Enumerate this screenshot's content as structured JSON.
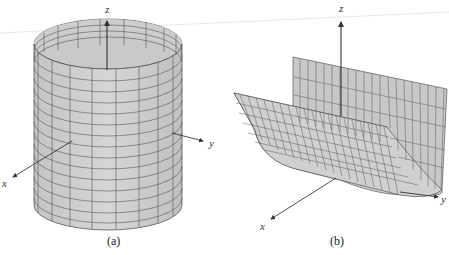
{
  "figures": [
    {
      "id": "a",
      "caption": "(a)",
      "surface": "cylinder",
      "axes": {
        "x": "x",
        "y": "y",
        "z": "z"
      }
    },
    {
      "id": "b",
      "caption": "(b)",
      "surface": "parabolic-cylinder",
      "axes": {
        "x": "x",
        "y": "y",
        "z": "z"
      }
    }
  ],
  "colors": {
    "surface_fill": "#cfcfcf",
    "surface_fill_dark": "#b9b9b9",
    "grid": "#555555",
    "axis": "#333333"
  }
}
